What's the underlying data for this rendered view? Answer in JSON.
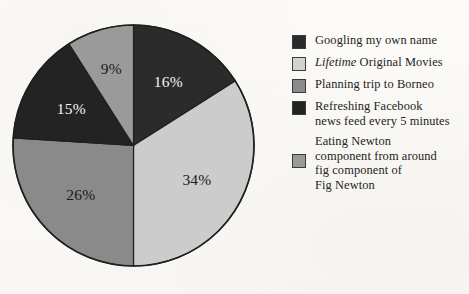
{
  "chart_data": {
    "type": "pie",
    "title": "",
    "categories": [
      "Googling my own name",
      "Lifetime Original Movies",
      "Planning trip to Borneo",
      "Refreshing Facebook news feed every 5 minutes",
      "Eating Newton component from around fig component of Fig Newton"
    ],
    "values": [
      16,
      34,
      26,
      15,
      9
    ],
    "value_labels": [
      "16%",
      "34%",
      "26%",
      "15%",
      "9%"
    ],
    "unit": "percent",
    "start_angle_deg": 0,
    "direction": "clockwise",
    "legend_position": "right",
    "grid": false,
    "colors": [
      "#2b2b2b",
      "#cccccc",
      "#8a8a8a",
      "#232323",
      "#9a9a9a"
    ],
    "label_text_colors": [
      "#f4f3ef",
      "#1a1a1a",
      "#1a1a1a",
      "#f4f3ef",
      "#1a1a1a"
    ]
  },
  "pie": {
    "slices": [
      {
        "label": "16%",
        "value": 16,
        "color": "#2b2b2b",
        "text_color": "light"
      },
      {
        "label": "34%",
        "value": 34,
        "color": "#cccccc",
        "text_color": "dark"
      },
      {
        "label": "26%",
        "value": 26,
        "color": "#8a8a8a",
        "text_color": "dark"
      },
      {
        "label": "15%",
        "value": 15,
        "color": "#232323",
        "text_color": "light"
      },
      {
        "label": "9%",
        "value": 9,
        "color": "#9a9a9a",
        "text_color": "dark"
      }
    ],
    "outline_color": "#1f1f1f"
  },
  "legend": {
    "items": [
      {
        "swatch_color": "#2b2b2b",
        "lines": [
          {
            "text": "Googling my own name",
            "italic_prefix": ""
          }
        ]
      },
      {
        "swatch_color": "#d2d2d2",
        "lines": [
          {
            "text": " Original Movies",
            "italic_prefix": "Lifetime"
          }
        ]
      },
      {
        "swatch_color": "#8a8a8a",
        "lines": [
          {
            "text": "Planning trip to Borneo",
            "italic_prefix": ""
          }
        ]
      },
      {
        "swatch_color": "#232323",
        "lines": [
          {
            "text": "Refreshing Facebook",
            "italic_prefix": ""
          },
          {
            "text": "news feed every 5 minutes",
            "italic_prefix": ""
          }
        ]
      },
      {
        "swatch_color": "#9a9a9a",
        "lines": [
          {
            "text": "Eating Newton",
            "italic_prefix": ""
          },
          {
            "text": "component from around",
            "italic_prefix": ""
          },
          {
            "text": "fig component of",
            "italic_prefix": ""
          },
          {
            "text": "Fig Newton",
            "italic_prefix": ""
          }
        ]
      }
    ]
  }
}
